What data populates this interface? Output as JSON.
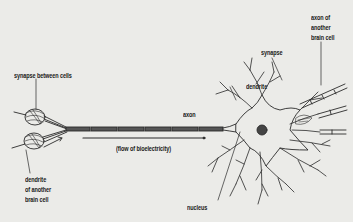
{
  "diagram": {
    "background_color": "#ebebe8",
    "line_color": "#2a2a2a",
    "labels": {
      "synapse_between_cells": "synapse between cells",
      "dendrite_of_another_1": "dendrite",
      "dendrite_of_another_2": "of another",
      "dendrite_of_another_3": "brain cell",
      "flow": "(flow of bioelectricity)",
      "axon": "axon",
      "nucleus": "nucleus",
      "dendrite": "dendrite",
      "synapse": "synapse",
      "axon_other_1": "axon of",
      "axon_other_2": "another",
      "axon_other_3": "brain cell"
    }
  }
}
